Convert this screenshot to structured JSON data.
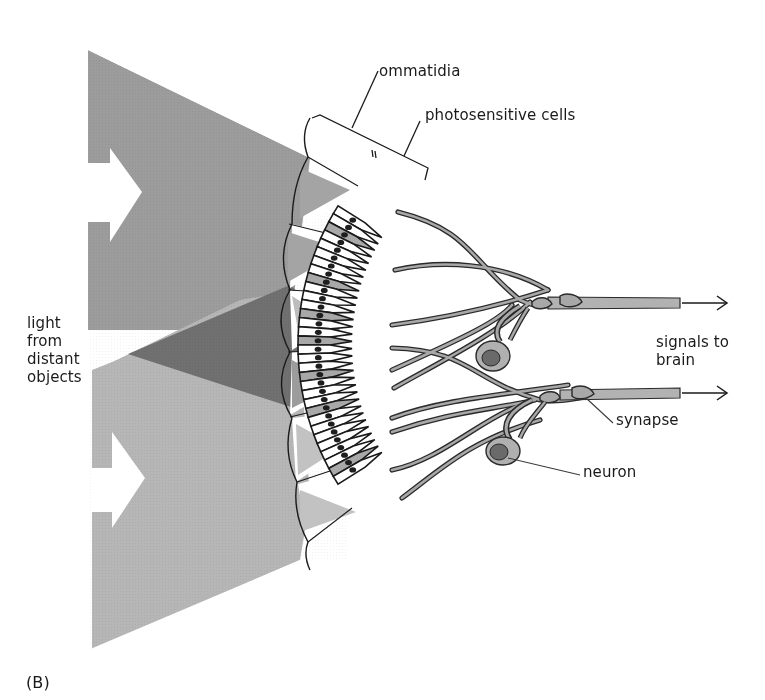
{
  "figure": {
    "panel_label": "(B)",
    "labels": {
      "ommatidia": "ommatidia",
      "photosensitive_cells": "photosensitive cells",
      "light_source": "light\nfrom\ndistant\nobjects",
      "signals": "signals to\nbrain",
      "synapse": "synapse",
      "neuron": "neuron"
    },
    "colors": {
      "upper_beam": "#9a9a9a",
      "lower_beam": "#b4b4b4",
      "overlap_beam": "#6e6e6e",
      "cell_fill": "#a8a8a8",
      "nucleus": "#1e1e1e",
      "outline": "#1a1a1a",
      "arrow_fill": "#ffffff"
    },
    "structure": {
      "ommatidia_count": 6,
      "photosensitive_cell_count": 32,
      "neuron_count": 2,
      "output_axons": 2
    }
  }
}
